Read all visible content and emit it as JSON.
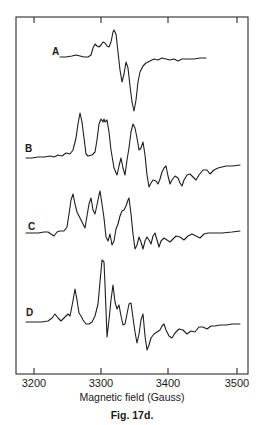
{
  "figure": {
    "caption": "Fig. 17d.",
    "xlabel": "Magnetic field (Gauss)"
  },
  "chart_data": {
    "type": "line",
    "title": "",
    "subtitle": "Stacked EPR spectra (first-derivative traces), offset vertically",
    "xlabel": "Magnetic field (Gauss)",
    "ylabel": "",
    "xlim": [
      3175,
      3520
    ],
    "xticks": [
      3200,
      3300,
      3400,
      3500
    ],
    "xtick_labels": [
      "3200",
      "3300",
      "3400",
      "3500"
    ],
    "grid": false,
    "legend": "inline labels left of each trace",
    "frame": {
      "left": 16,
      "top": 17,
      "right": 248,
      "bottom": 374
    },
    "tick_px": [
      34,
      101,
      168,
      237
    ],
    "series": [
      {
        "name": "A",
        "label_pos": [
          52,
          55
        ],
        "field_range_gauss": [
          3240,
          3455
        ],
        "approx_features_gauss": {
          "max_peak": 3320,
          "min_trough": 3350,
          "secondary_trough": 3333
        },
        "points": [
          [
            60,
            57
          ],
          [
            66,
            57
          ],
          [
            72,
            56
          ],
          [
            76,
            55
          ],
          [
            80,
            56
          ],
          [
            84,
            57
          ],
          [
            88,
            57
          ],
          [
            91,
            55
          ],
          [
            93,
            48
          ],
          [
            95,
            44
          ],
          [
            97,
            46
          ],
          [
            99,
            47
          ],
          [
            101,
            45
          ],
          [
            103,
            42
          ],
          [
            105,
            43
          ],
          [
            107,
            46
          ],
          [
            109,
            47
          ],
          [
            111,
            42
          ],
          [
            113,
            32
          ],
          [
            114,
            30
          ],
          [
            116,
            34
          ],
          [
            118,
            52
          ],
          [
            120,
            70
          ],
          [
            122,
            82
          ],
          [
            124,
            74
          ],
          [
            126,
            62
          ],
          [
            128,
            68
          ],
          [
            130,
            86
          ],
          [
            132,
            102
          ],
          [
            134,
            111
          ],
          [
            136,
            100
          ],
          [
            138,
            82
          ],
          [
            140,
            72
          ],
          [
            143,
            66
          ],
          [
            146,
            63
          ],
          [
            150,
            61
          ],
          [
            154,
            59
          ],
          [
            158,
            60
          ],
          [
            162,
            58
          ],
          [
            166,
            59
          ],
          [
            170,
            60
          ],
          [
            174,
            59
          ],
          [
            178,
            61
          ],
          [
            182,
            59
          ],
          [
            188,
            59
          ],
          [
            194,
            59
          ],
          [
            200,
            58
          ],
          [
            206,
            58
          ]
        ]
      },
      {
        "name": "B",
        "label_pos": [
          25,
          152
        ],
        "field_range_gauss": [
          3190,
          3505
        ],
        "points": [
          [
            26,
            158
          ],
          [
            32,
            158
          ],
          [
            38,
            157
          ],
          [
            44,
            157
          ],
          [
            50,
            156
          ],
          [
            54,
            157
          ],
          [
            58,
            155
          ],
          [
            62,
            156
          ],
          [
            66,
            153
          ],
          [
            70,
            154
          ],
          [
            73,
            150
          ],
          [
            76,
            138
          ],
          [
            78,
            124
          ],
          [
            80,
            113
          ],
          [
            82,
            122
          ],
          [
            84,
            138
          ],
          [
            86,
            154
          ],
          [
            88,
            156
          ],
          [
            92,
            155
          ],
          [
            95,
            152
          ],
          [
            97,
            140
          ],
          [
            99,
            124
          ],
          [
            101,
            119
          ],
          [
            103,
            122
          ],
          [
            104,
            119
          ],
          [
            105,
            122
          ],
          [
            107,
            120
          ],
          [
            109,
            132
          ],
          [
            111,
            150
          ],
          [
            114,
            168
          ],
          [
            117,
            175
          ],
          [
            119,
            166
          ],
          [
            121,
            158
          ],
          [
            123,
            168
          ],
          [
            125,
            175
          ],
          [
            127,
            160
          ],
          [
            129,
            148
          ],
          [
            131,
            132
          ],
          [
            133,
            124
          ],
          [
            135,
            128
          ],
          [
            137,
            138
          ],
          [
            139,
            150
          ],
          [
            141,
            148
          ],
          [
            143,
            142
          ],
          [
            145,
            155
          ],
          [
            147,
            175
          ],
          [
            149,
            187
          ],
          [
            151,
            183
          ],
          [
            153,
            180
          ],
          [
            156,
            181
          ],
          [
            158,
            184
          ],
          [
            160,
            179
          ],
          [
            162,
            172
          ],
          [
            164,
            168
          ],
          [
            166,
            166
          ],
          [
            168,
            176
          ],
          [
            170,
            184
          ],
          [
            172,
            180
          ],
          [
            175,
            176
          ],
          [
            178,
            178
          ],
          [
            180,
            183
          ],
          [
            182,
            186
          ],
          [
            184,
            180
          ],
          [
            187,
            175
          ],
          [
            190,
            174
          ],
          [
            193,
            177
          ],
          [
            196,
            180
          ],
          [
            199,
            175
          ],
          [
            203,
            170
          ],
          [
            207,
            170
          ],
          [
            210,
            174
          ],
          [
            214,
            170
          ],
          [
            218,
            168
          ],
          [
            222,
            167
          ],
          [
            226,
            166
          ],
          [
            232,
            166
          ],
          [
            240,
            165
          ]
        ]
      },
      {
        "name": "C",
        "label_pos": [
          28,
          230
        ],
        "field_range_gauss": [
          3190,
          3505
        ],
        "points": [
          [
            26,
            233
          ],
          [
            32,
            233
          ],
          [
            38,
            233
          ],
          [
            44,
            232
          ],
          [
            48,
            232
          ],
          [
            51,
            234
          ],
          [
            54,
            236
          ],
          [
            57,
            232
          ],
          [
            60,
            231
          ],
          [
            64,
            231
          ],
          [
            67,
            227
          ],
          [
            69,
            214
          ],
          [
            71,
            200
          ],
          [
            73,
            194
          ],
          [
            75,
            204
          ],
          [
            77,
            212
          ],
          [
            79,
            216
          ],
          [
            81,
            220
          ],
          [
            83,
            224
          ],
          [
            85,
            228
          ],
          [
            87,
            216
          ],
          [
            89,
            204
          ],
          [
            91,
            198
          ],
          [
            93,
            210
          ],
          [
            95,
            214
          ],
          [
            97,
            205
          ],
          [
            99,
            195
          ],
          [
            100,
            191
          ],
          [
            102,
            204
          ],
          [
            104,
            218
          ],
          [
            106,
            237
          ],
          [
            108,
            241
          ],
          [
            110,
            234
          ],
          [
            112,
            245
          ],
          [
            114,
            241
          ],
          [
            116,
            229
          ],
          [
            118,
            224
          ],
          [
            120,
            216
          ],
          [
            122,
            211
          ],
          [
            124,
            210
          ],
          [
            126,
            206
          ],
          [
            128,
            200
          ],
          [
            129,
            198
          ],
          [
            131,
            214
          ],
          [
            133,
            234
          ],
          [
            135,
            249
          ],
          [
            137,
            245
          ],
          [
            139,
            237
          ],
          [
            141,
            242
          ],
          [
            143,
            249
          ],
          [
            145,
            241
          ],
          [
            147,
            237
          ],
          [
            149,
            240
          ],
          [
            151,
            244
          ],
          [
            153,
            236
          ],
          [
            155,
            233
          ],
          [
            157,
            240
          ],
          [
            159,
            247
          ],
          [
            161,
            241
          ],
          [
            164,
            238
          ],
          [
            167,
            240
          ],
          [
            170,
            242
          ],
          [
            173,
            239
          ],
          [
            176,
            236
          ],
          [
            180,
            237
          ],
          [
            184,
            240
          ],
          [
            188,
            236
          ],
          [
            192,
            234
          ],
          [
            196,
            236
          ],
          [
            200,
            238
          ],
          [
            204,
            234
          ],
          [
            208,
            233
          ],
          [
            214,
            233
          ],
          [
            222,
            233
          ],
          [
            232,
            232
          ],
          [
            240,
            231
          ]
        ]
      },
      {
        "name": "D",
        "label_pos": [
          26,
          316
        ],
        "field_range_gauss": [
          3190,
          3505
        ],
        "points": [
          [
            26,
            322
          ],
          [
            34,
            322
          ],
          [
            42,
            322
          ],
          [
            48,
            321
          ],
          [
            52,
            318
          ],
          [
            55,
            314
          ],
          [
            58,
            318
          ],
          [
            61,
            321
          ],
          [
            64,
            318
          ],
          [
            66,
            316
          ],
          [
            68,
            314
          ],
          [
            70,
            316
          ],
          [
            72,
            306
          ],
          [
            74,
            295
          ],
          [
            75,
            289
          ],
          [
            77,
            300
          ],
          [
            79,
            313
          ],
          [
            81,
            316
          ],
          [
            83,
            320
          ],
          [
            86,
            324
          ],
          [
            89,
            324
          ],
          [
            92,
            322
          ],
          [
            95,
            316
          ],
          [
            98,
            304
          ],
          [
            100,
            282
          ],
          [
            102,
            260
          ],
          [
            104,
            262
          ],
          [
            105,
            285
          ],
          [
            106,
            310
          ],
          [
            107,
            337
          ],
          [
            109,
            320
          ],
          [
            111,
            300
          ],
          [
            113,
            285
          ],
          [
            115,
            302
          ],
          [
            117,
            309
          ],
          [
            119,
            305
          ],
          [
            121,
            316
          ],
          [
            123,
            325
          ],
          [
            125,
            324
          ],
          [
            127,
            314
          ],
          [
            129,
            304
          ],
          [
            131,
            303
          ],
          [
            133,
            318
          ],
          [
            135,
            332
          ],
          [
            137,
            343
          ],
          [
            139,
            334
          ],
          [
            141,
            320
          ],
          [
            143,
            314
          ],
          [
            145,
            336
          ],
          [
            147,
            350
          ],
          [
            149,
            345
          ],
          [
            151,
            338
          ],
          [
            154,
            334
          ],
          [
            157,
            332
          ],
          [
            160,
            330
          ],
          [
            162,
            326
          ],
          [
            164,
            324
          ],
          [
            166,
            330
          ],
          [
            169,
            336
          ],
          [
            172,
            338
          ],
          [
            175,
            333
          ],
          [
            179,
            329
          ],
          [
            183,
            330
          ],
          [
            187,
            334
          ],
          [
            191,
            331
          ],
          [
            195,
            332
          ],
          [
            199,
            327
          ],
          [
            203,
            327
          ],
          [
            207,
            329
          ],
          [
            211,
            326
          ],
          [
            215,
            326
          ],
          [
            220,
            325
          ],
          [
            226,
            325
          ],
          [
            232,
            324
          ],
          [
            240,
            324
          ]
        ]
      }
    ]
  }
}
